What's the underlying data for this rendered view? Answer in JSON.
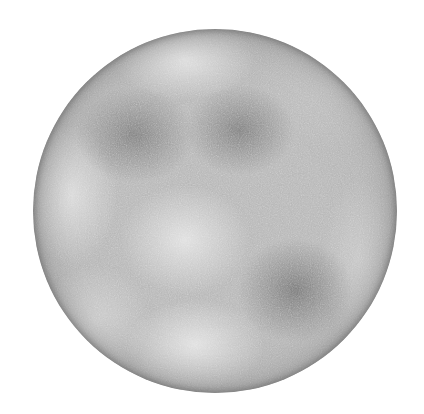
{
  "scene": {
    "description": "Grayscale noise-textured sphere on white background",
    "background_color": "#ffffff",
    "sphere": {
      "center": [
        215,
        211
      ],
      "radius": 182,
      "base_color": "#b4b4b4",
      "edge_color": "#8c8c8c"
    },
    "dark_patches": [
      {
        "name": "upper-left-dark",
        "center": [
          135,
          135
        ],
        "color": "#8f8f8f"
      },
      {
        "name": "upper-center-dark",
        "center": [
          240,
          130
        ],
        "color": "#8f8f8f"
      },
      {
        "name": "lower-right-dark",
        "center": [
          295,
          290
        ],
        "color": "#8c8c8c"
      }
    ],
    "light_patches": [
      {
        "name": "top-light",
        "center": [
          185,
          60
        ],
        "color": "#dcdcdc"
      },
      {
        "name": "left-light",
        "center": [
          72,
          195
        ],
        "color": "#d8d8d8"
      },
      {
        "name": "center-light",
        "center": [
          185,
          240
        ],
        "color": "#dadada"
      },
      {
        "name": "bottom-light",
        "center": [
          195,
          345
        ],
        "color": "#dcdcdc"
      },
      {
        "name": "lower-left-light",
        "center": [
          95,
          320
        ],
        "color": "#d2d2d2"
      },
      {
        "name": "right-light",
        "center": [
          360,
          260
        ],
        "color": "#cfcfcf"
      }
    ]
  }
}
